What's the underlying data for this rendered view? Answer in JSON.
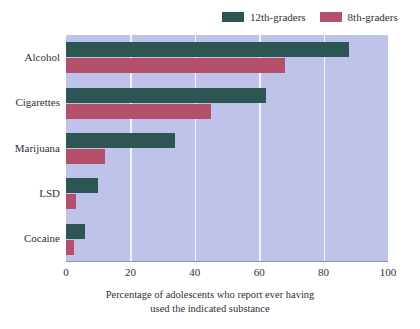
{
  "chart_data": {
    "type": "bar",
    "orientation": "horizontal",
    "title": "",
    "xlabel": "Percentage of adolescents who report ever having used the indicated substance",
    "xlabel_line1": "Percentage of adolescents who report ever having",
    "xlabel_line2": "used the indicated substance",
    "ylabel": "",
    "categories": [
      "Alcohol",
      "Cigarettes",
      "Marijuana",
      "LSD",
      "Cocaine"
    ],
    "series": [
      {
        "name": "12th-graders",
        "color": "#2d5553",
        "values": [
          88,
          62,
          34,
          10,
          6
        ]
      },
      {
        "name": "8th-graders",
        "color": "#b5506c",
        "values": [
          68,
          45,
          12,
          3,
          2.5
        ]
      }
    ],
    "xlim": [
      0,
      100
    ],
    "xticks": [
      0,
      20,
      40,
      60,
      80,
      100
    ],
    "xtick_labels": [
      "0",
      "20",
      "40",
      "60",
      "80",
      "100"
    ],
    "grid": true,
    "grid_axis": "x",
    "legend_position": "top-right",
    "plot_background": "#bfc3e9",
    "gridline_color": "#f2f3fb",
    "figure_background": "#ffffff"
  }
}
